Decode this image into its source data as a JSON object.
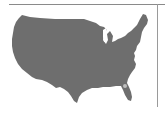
{
  "map": {
    "subject": "United States (contiguous) silhouette",
    "fill_color": "#6e6e6e",
    "highlight_color": "#bdbdbd",
    "background_color": "#ffffff",
    "frame_color": "#8a8a8a",
    "highlight_region": "Florida (small light spot)"
  }
}
